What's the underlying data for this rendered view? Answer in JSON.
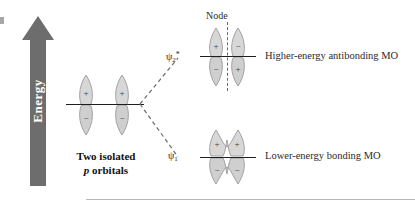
{
  "figure": {
    "type": "molecular-orbital-diagram",
    "axis_label": "Energy",
    "node_label": "Node",
    "caption_line1": "Two isolated",
    "caption_italic": "p",
    "caption_line2": "orbitals"
  },
  "levels": [
    {
      "id": "antibonding",
      "psi_base": "ψ",
      "psi_sub": "2",
      "psi_star": "*",
      "label": "Higher-energy antibonding MO",
      "has_node": true,
      "lobes": [
        {
          "position": "top-left",
          "sign": "+"
        },
        {
          "position": "top-right",
          "sign": "−"
        },
        {
          "position": "bottom-left",
          "sign": "−"
        },
        {
          "position": "bottom-right",
          "sign": "+"
        }
      ]
    },
    {
      "id": "bonding",
      "psi_base": "ψ",
      "psi_sub": "1",
      "psi_star": "",
      "label": "Lower-energy bonding MO",
      "has_node": false,
      "lobes": [
        {
          "position": "top-left",
          "sign": "+"
        },
        {
          "position": "top-right",
          "sign": "+"
        },
        {
          "position": "bottom-left",
          "sign": "−"
        },
        {
          "position": "bottom-right",
          "sign": "−"
        }
      ]
    }
  ],
  "isolated_orbitals": {
    "lobes": [
      {
        "position": "left-top",
        "sign": "+"
      },
      {
        "position": "right-top",
        "sign": "+"
      },
      {
        "position": "left-bottom",
        "sign": "−"
      },
      {
        "position": "right-bottom",
        "sign": "−"
      }
    ]
  },
  "colors": {
    "arrow": "#6d6d6d",
    "lobe_fill": "#d7d7d7",
    "lobe_stroke": "#9a9a9a",
    "level_line": "#1e1e1e",
    "dashed": "#6a6a6a",
    "text": "#2b2b2b",
    "rule": "#b9b9b9",
    "background": "#ffffff"
  }
}
